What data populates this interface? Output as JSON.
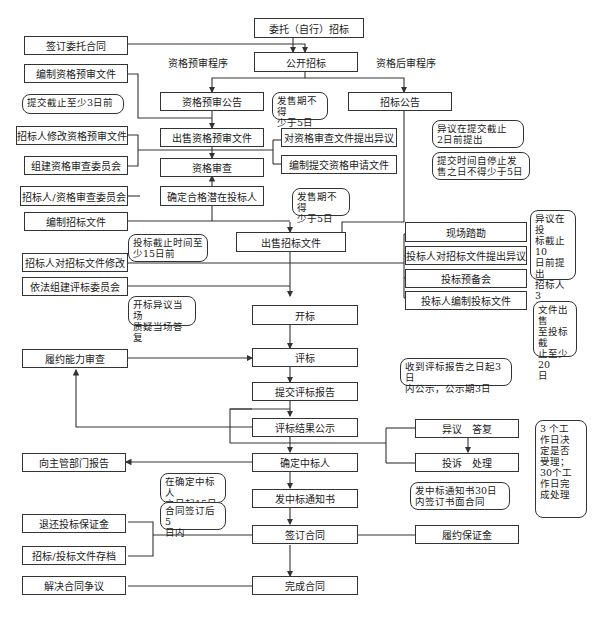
{
  "labels": {
    "prequal": "资格预审程序",
    "postqual": "资格后审程序"
  },
  "main": {
    "entrust": "委托（自行）招标",
    "public_tender": "公开招标",
    "prequal_notice": "资格预审公告",
    "sell_prequal_docs": "出售资格预审文件",
    "prequal_review": "资格审查",
    "confirm_bidders": "确定合格潜在投标人",
    "sell_tender_docs": "出售招标文件",
    "bid_open": "开标",
    "evaluation": "评标",
    "submit_report": "提交评标报告",
    "publicize_result": "评标结果公示",
    "determine_winner": "确定中标人",
    "issue_notice": "发中标通知书",
    "sign_contract": "签订合同",
    "complete_contract": "完成合同"
  },
  "left": {
    "sign_entrust_contract": "签订委托合同",
    "prepare_prequal_docs": "编制资格预审文件",
    "modify_prequal_docs": "招标人修改资格预审文件",
    "form_prequal_committee": "组建资格审查委员会",
    "tenderer_committee": "招标人/资格审查委员会",
    "prepare_tender_docs": "编制招标文件",
    "modify_tender_docs": "招标人对招标文件修改",
    "form_eval_committee": "依法组建评标委员会",
    "performance_review": "履约能力审查",
    "report_authority": "向主管部门报告",
    "refund_deposit": "退还投标保证金",
    "archive_docs": "招标/投标文件存档",
    "resolve_disputes": "解决合同争议"
  },
  "right": {
    "tender_notice": "招标公告",
    "object_prequal_docs": "对资格审查文件提出异议",
    "prepare_application": "编制提交资格申请文件",
    "site_visit": "现场踏勘",
    "bidder_objection": "投标人对招标文件提出异议",
    "pre_bid_meeting": "投标预备会",
    "prepare_bid_docs": "投标人编制投标文件",
    "objection_reply": "异议　答复",
    "complaint_handling": "投诉　处理",
    "performance_bond": "履约保证金"
  },
  "notes": {
    "submit_3days": "提交截止至少3日前",
    "sale_5days_a": "发售期不得\n少于5日",
    "objection_2days": "异议在提交截止\n2日前提出",
    "submit_time_5days": "提交时间自停止发\n售之日不得少于5日",
    "sale_5days_b": "发售期不得\n少于5日",
    "deadline_15days": "投标截止时间至\n少15日前",
    "objection_10days": "异议在投\n标截止10\n日前提出\n招标人3\n日内答复",
    "docs_20days": "文件出售\n至投标截\n止至少20\n日",
    "opening_objection": "开标异议当场\n质疑当场答复",
    "publicity_3days": "收到评标报告之日起3日\n内公示，公示期3日",
    "complaint_days": "3 个工\n作日决\n定是否\n受理；\n30个工\n作日完\n成处理",
    "report_15days": "在确定中标人\n之日起15日内",
    "refund_5days": "合同签订后5\n日内",
    "contract_30days": "发中标通知书30日\n内签订书面合同"
  }
}
